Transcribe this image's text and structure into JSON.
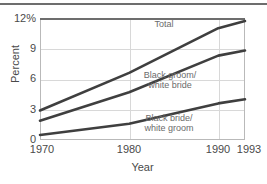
{
  "chart_data": {
    "type": "line",
    "title": "",
    "xlabel": "Year",
    "ylabel": "Percent",
    "x": [
      1970,
      1980,
      1990,
      1993
    ],
    "xlim": [
      1970,
      1993
    ],
    "ylim": [
      0,
      12
    ],
    "yticks": [
      0,
      3,
      6,
      9,
      12
    ],
    "ytick_labels": [
      "0",
      "3",
      "6",
      "9",
      "12%"
    ],
    "xtick_labels": [
      "1970",
      "1980",
      "1990",
      "1993"
    ],
    "grid": true,
    "legend_position": "inline-annotations",
    "series": [
      {
        "name": "Total",
        "label": "Total",
        "values": [
          2.9,
          6.6,
          11.0,
          11.7
        ],
        "color": "#3f3f3f"
      },
      {
        "name": "Black groom/white bride",
        "label_line1": "Black groom/",
        "label_line2": "white bride",
        "values": [
          1.9,
          4.7,
          8.3,
          8.8
        ],
        "color": "#3f3f3f"
      },
      {
        "name": "Black bride/white groom",
        "label_line1": "Black bride/",
        "label_line2": "white groom",
        "values": [
          0.5,
          1.6,
          3.6,
          4.0
        ],
        "color": "#3f3f3f"
      }
    ]
  },
  "axis": {
    "ytick_0": "0",
    "ytick_3": "3",
    "ytick_6": "6",
    "ytick_9": "9",
    "ytick_12": "12%",
    "xtick_1970": "1970",
    "xtick_1980": "1980",
    "xtick_1990": "1990",
    "xtick_1993": "1993",
    "ylabel": "Percent",
    "xlabel": "Year"
  },
  "annotations": {
    "total": "Total",
    "groom_line1": "Black groom/",
    "groom_line2": "white bride",
    "bride_line1": "Black bride/",
    "bride_line2": "white groom"
  },
  "colors": {
    "line": "#3f3f3f",
    "grid": "#d8d8d8",
    "frame": "#b9b9b9",
    "text": "#4a4a4a",
    "annotation_text": "#6b6b6b",
    "rule": "#6d6d6d",
    "background": "#ffffff"
  }
}
